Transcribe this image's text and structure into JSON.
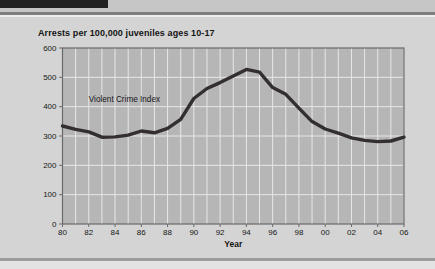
{
  "chart_data": {
    "type": "line",
    "title": "Arrests per 100,000 juveniles ages 10-17",
    "xlabel": "Year",
    "ylabel": "",
    "x": [
      1980,
      1981,
      1982,
      1983,
      1984,
      1985,
      1986,
      1987,
      1988,
      1989,
      1990,
      1991,
      1992,
      1993,
      1994,
      1995,
      1996,
      1997,
      1998,
      1999,
      2000,
      2001,
      2002,
      2003,
      2004,
      2005,
      2006
    ],
    "x_tick_years": [
      1980,
      1982,
      1984,
      1986,
      1988,
      1990,
      1992,
      1994,
      1996,
      1998,
      2000,
      2002,
      2004,
      2006
    ],
    "x_tick_labels": [
      "80",
      "82",
      "84",
      "86",
      "88",
      "90",
      "92",
      "94",
      "96",
      "98",
      "00",
      "02",
      "04",
      "06"
    ],
    "y_ticks": [
      0,
      100,
      200,
      300,
      400,
      500,
      600
    ],
    "ylim": [
      0,
      600
    ],
    "grid": true,
    "legend_position": "none",
    "annotation": {
      "text": "Violent Crime Index",
      "x": 1982,
      "y": 415
    },
    "series": [
      {
        "name": "Violent Crime Index",
        "values": [
          334,
          323,
          314,
          296,
          297,
          303,
          317,
          311,
          326,
          357,
          428,
          462,
          482,
          505,
          527,
          518,
          465,
          442,
          395,
          349,
          324,
          310,
          294,
          285,
          281,
          283,
          296
        ]
      }
    ],
    "colors": {
      "line": "#332f2f",
      "plot_bg": "#b6b6b6",
      "grid": "#e7e7e7",
      "axis": "#6a6a6a",
      "text": "#161616"
    }
  },
  "page": {
    "top_bar_color": "#222222",
    "panel_color": "#d4d4d4",
    "background_color": "#c6c6c6"
  }
}
